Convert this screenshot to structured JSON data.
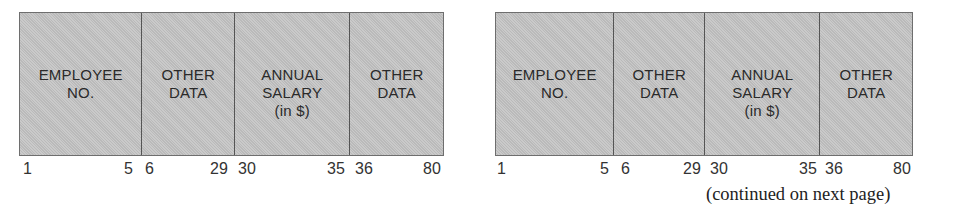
{
  "records": [
    {
      "fields": [
        {
          "label": "EMPLOYEE\nNO.",
          "start_col": "1",
          "end_col": "5"
        },
        {
          "label": "OTHER\nDATA",
          "start_col": "6",
          "end_col": "29"
        },
        {
          "label": "ANNUAL\nSALARY\n(in $)",
          "start_col": "30",
          "end_col": "35"
        },
        {
          "label": "OTHER\nDATA",
          "start_col": "36",
          "end_col": "80"
        }
      ]
    },
    {
      "fields": [
        {
          "label": "EMPLOYEE\nNO.",
          "start_col": "1",
          "end_col": "5"
        },
        {
          "label": "OTHER\nDATA",
          "start_col": "6",
          "end_col": "29"
        },
        {
          "label": "ANNUAL\nSALARY\n(in $)",
          "start_col": "30",
          "end_col": "35"
        },
        {
          "label": "OTHER\nDATA",
          "start_col": "36",
          "end_col": "80"
        }
      ]
    }
  ],
  "continuation_note": "(continued on next page)",
  "colors": {
    "field_fill": "#c4c4c4",
    "border": "#555555",
    "text": "#2a2a2a"
  }
}
